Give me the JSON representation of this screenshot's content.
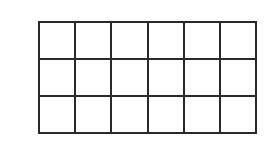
{
  "diagram": {
    "type": "rectangular-grid",
    "rows": 3,
    "columns": 6,
    "cell_count": 18,
    "line_color": "#2a2a2a",
    "fill_color": "#ffffff",
    "cells": []
  }
}
